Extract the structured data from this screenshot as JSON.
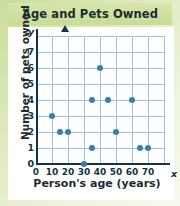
{
  "chart_data": {
    "type": "scatter",
    "title": "Age and Pets Owned",
    "xlabel": "Person's age (years)",
    "ylabel": "Number of pets owned",
    "x_var": "x",
    "y_var": "y",
    "xlim": [
      0,
      80
    ],
    "ylim": [
      0,
      8
    ],
    "xticks": [
      0,
      10,
      20,
      30,
      40,
      50,
      60,
      70
    ],
    "yticks": [
      0,
      1,
      2,
      3,
      4,
      5,
      6,
      7
    ],
    "grid": true,
    "legend": null,
    "point_color": "#3d7ab0",
    "grid_color": "#9cc4e0",
    "axis_color": "#16343f",
    "title_band_color": "#cfe1a0",
    "points": [
      {
        "x": 10,
        "y": 3
      },
      {
        "x": 15,
        "y": 2
      },
      {
        "x": 20,
        "y": 2
      },
      {
        "x": 30,
        "y": 0
      },
      {
        "x": 35,
        "y": 1
      },
      {
        "x": 35,
        "y": 4
      },
      {
        "x": 40,
        "y": 6
      },
      {
        "x": 45,
        "y": 4
      },
      {
        "x": 50,
        "y": 2
      },
      {
        "x": 60,
        "y": 4
      },
      {
        "x": 65,
        "y": 1
      },
      {
        "x": 70,
        "y": 1
      }
    ]
  }
}
